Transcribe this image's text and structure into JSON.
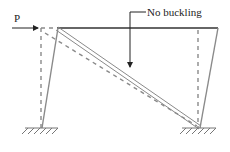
{
  "diagram": {
    "load_label": "P",
    "annotation_label": "No buckling",
    "colors": {
      "beam": "#333333",
      "column": "#8a8a8a",
      "brace": "#8a8a8a",
      "deformed": "#8a8a8a",
      "arrow": "#222222",
      "ground": "#777777",
      "text": "#222222"
    },
    "elements": {
      "beam": "top beam (solid)",
      "left_column": "left column (solid, inclined)",
      "right_column": "right column (solid, inclined)",
      "brace": "diagonal brace (double line)",
      "deformed_shape": "dashed original/deformed outline",
      "supports": "fixed ground supports (hatched)"
    }
  }
}
